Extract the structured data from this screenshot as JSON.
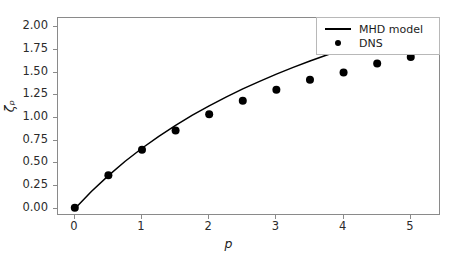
{
  "chart_data": {
    "type": "line",
    "title": "",
    "xlabel": "p",
    "ylabel": "ζₚ",
    "xlim": [
      -0.25,
      5.45
    ],
    "ylim": [
      -0.08,
      2.1
    ],
    "xticks": [
      "0",
      "1",
      "2",
      "3",
      "4",
      "5"
    ],
    "xtick_values": [
      0,
      1,
      2,
      3,
      4,
      5
    ],
    "yticks": [
      "0.00",
      "0.25",
      "0.50",
      "0.75",
      "1.00",
      "1.25",
      "1.50",
      "1.75",
      "2.00"
    ],
    "ytick_values": [
      0.0,
      0.25,
      0.5,
      0.75,
      1.0,
      1.25,
      1.5,
      1.75,
      2.0
    ],
    "grid": false,
    "legend_position": "upper right",
    "series": [
      {
        "name": "MHD model",
        "style": "line",
        "color": "#000000",
        "x": [
          0.0,
          0.25,
          0.5,
          0.75,
          1.0,
          1.25,
          1.5,
          1.75,
          2.0,
          2.25,
          2.5,
          2.75,
          3.0,
          3.25,
          3.5,
          3.75,
          4.0,
          4.25,
          4.5,
          4.75,
          5.0
        ],
        "y": [
          0.0,
          0.192,
          0.365,
          0.523,
          0.666,
          0.797,
          0.918,
          1.03,
          1.133,
          1.229,
          1.319,
          1.403,
          1.482,
          1.556,
          1.626,
          1.692,
          1.755,
          1.815,
          1.872,
          1.926,
          1.978
        ]
      },
      {
        "name": "DNS",
        "style": "marker",
        "color": "#000000",
        "x": [
          0.0,
          0.5,
          1.0,
          1.5,
          2.0,
          2.5,
          3.0,
          3.5,
          4.0,
          4.5,
          5.0
        ],
        "y": [
          0.01,
          0.37,
          0.65,
          0.86,
          1.04,
          1.19,
          1.31,
          1.42,
          1.5,
          1.6,
          1.67
        ]
      }
    ]
  },
  "legend": {
    "entries": [
      {
        "label": "MHD model",
        "key": "line-key"
      },
      {
        "label": "DNS",
        "key": "dot-key"
      }
    ]
  },
  "colors": {
    "line": "#000000",
    "marker": "#000000",
    "axis": "#8a8a8a",
    "text": "#1c1c1c",
    "background": "#ffffff"
  }
}
